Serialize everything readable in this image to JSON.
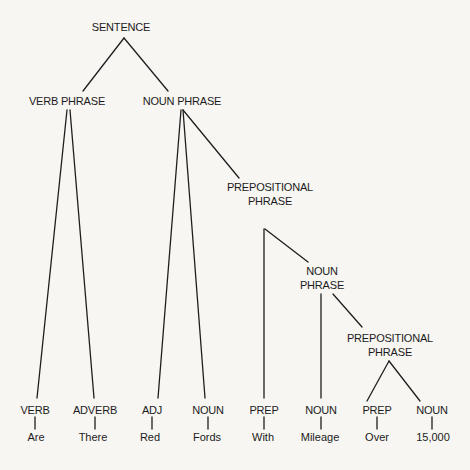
{
  "diagram": {
    "type": "parse-tree",
    "nodes": {
      "sentence": {
        "label": "SENTENCE"
      },
      "verb_phrase": {
        "label": "VERB PHRASE"
      },
      "noun_phrase_1": {
        "label": "NOUN PHRASE"
      },
      "prep_phrase_1": {
        "line1": "PREPOSITIONAL",
        "line2": "PHRASE"
      },
      "noun_phrase_2": {
        "line1": "NOUN",
        "line2": "PHRASE"
      },
      "prep_phrase_2": {
        "line1": "PREPOSITIONAL",
        "line2": "PHRASE"
      }
    },
    "leaves": [
      {
        "pos": "VERB",
        "word": "Are"
      },
      {
        "pos": "ADVERB",
        "word": "There"
      },
      {
        "pos": "ADJ",
        "word": "Red"
      },
      {
        "pos": "NOUN",
        "word": "Fords"
      },
      {
        "pos": "PREP",
        "word": "With"
      },
      {
        "pos": "NOUN",
        "word": "Mileage"
      },
      {
        "pos": "PREP",
        "word": "Over"
      },
      {
        "pos": "NOUN",
        "word": "15,000"
      }
    ],
    "edges": [
      [
        "SENTENCE",
        "VERB PHRASE"
      ],
      [
        "SENTENCE",
        "NOUN PHRASE"
      ],
      [
        "VERB PHRASE",
        "VERB"
      ],
      [
        "VERB PHRASE",
        "ADVERB"
      ],
      [
        "NOUN PHRASE",
        "ADJ"
      ],
      [
        "NOUN PHRASE",
        "NOUN"
      ],
      [
        "NOUN PHRASE",
        "PREPOSITIONAL PHRASE"
      ],
      [
        "PREPOSITIONAL PHRASE",
        "PREP"
      ],
      [
        "PREPOSITIONAL PHRASE",
        "NOUN PHRASE"
      ],
      [
        "NOUN PHRASE",
        "NOUN"
      ],
      [
        "NOUN PHRASE",
        "PREPOSITIONAL PHRASE"
      ],
      [
        "PREPOSITIONAL PHRASE",
        "PREP"
      ],
      [
        "PREPOSITIONAL PHRASE",
        "NOUN"
      ]
    ]
  }
}
